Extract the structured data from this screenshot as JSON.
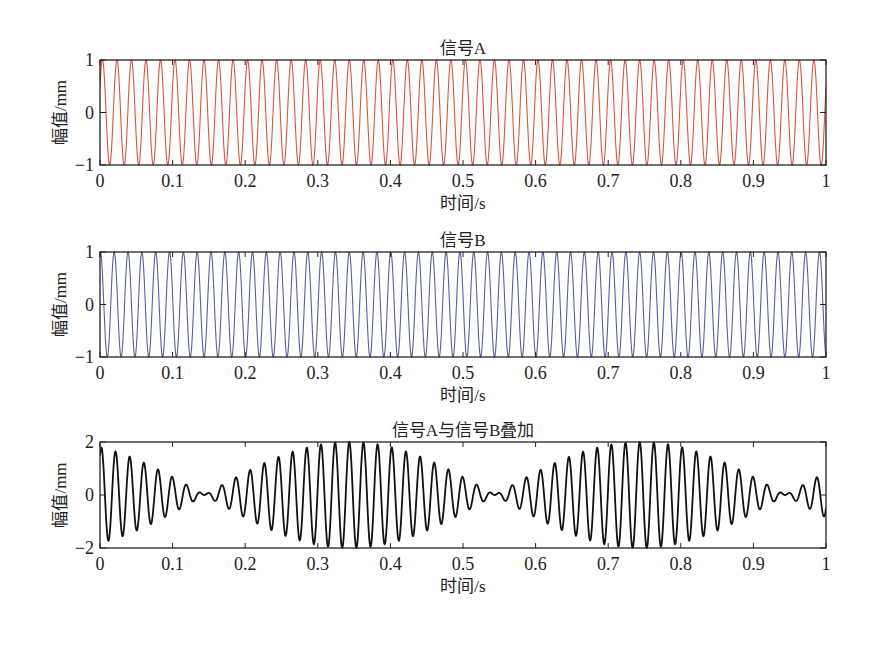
{
  "chart_data": [
    {
      "type": "line",
      "title": "信号A",
      "xlabel": "时间/s",
      "ylabel": "幅值/mm",
      "xlim": [
        0,
        1
      ],
      "ylim": [
        -1,
        1
      ],
      "xticks": [
        "0",
        "0.1",
        "0.2",
        "0.3",
        "0.4",
        "0.5",
        "0.6",
        "0.7",
        "0.8",
        "0.9",
        "1"
      ],
      "yticks": [
        "-1",
        "0",
        "1"
      ],
      "grid": false,
      "series": [
        {
          "name": "信号A",
          "color": "#d9573b",
          "function": "sin",
          "amplitude": 1,
          "frequency_hz": 50,
          "phase_rad": 0.52
        }
      ]
    },
    {
      "type": "line",
      "title": "信号B",
      "xlabel": "时间/s",
      "ylabel": "幅值/mm",
      "xlim": [
        0,
        1
      ],
      "ylim": [
        -1,
        1
      ],
      "xticks": [
        "0",
        "0.1",
        "0.2",
        "0.3",
        "0.4",
        "0.5",
        "0.6",
        "0.7",
        "0.8",
        "0.9",
        "1"
      ],
      "yticks": [
        "-1",
        "0",
        "1"
      ],
      "grid": false,
      "series": [
        {
          "name": "信号B",
          "color": "#5a5f9c",
          "function": "sin",
          "amplitude": 1,
          "frequency_hz": 52.5,
          "phase_rad": 1.4
        }
      ]
    },
    {
      "type": "line",
      "title": "信号A与信号B叠加",
      "xlabel": "时间/s",
      "ylabel": "幅值/mm",
      "xlim": [
        0,
        1
      ],
      "ylim": [
        -2,
        2
      ],
      "xticks": [
        "0",
        "0.1",
        "0.2",
        "0.3",
        "0.4",
        "0.5",
        "0.6",
        "0.7",
        "0.8",
        "0.9",
        "1"
      ],
      "yticks": [
        "-2",
        "0",
        "2"
      ],
      "grid": false,
      "series": [
        {
          "name": "信号A+信号B",
          "color": "#111111",
          "function": "sum_of_A_and_B",
          "beat_period_s": 0.4
        }
      ]
    }
  ]
}
